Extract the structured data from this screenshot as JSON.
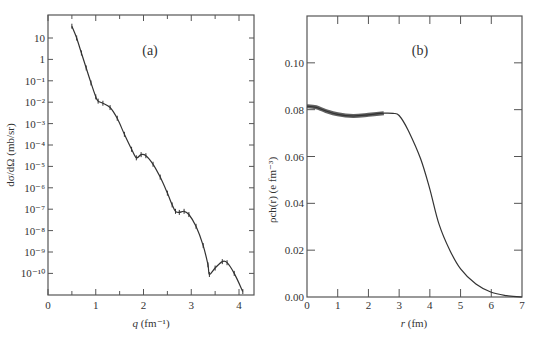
{
  "chart_data": [
    {
      "type": "line",
      "panel_label": "(a)",
      "title": "",
      "xlabel": "q (fm⁻¹)",
      "xlabel_var": "q",
      "xlabel_unit": "(fm⁻¹)",
      "ylabel": "dσ/dΩ (mb/sr)",
      "yscale": "log",
      "xlim": [
        0,
        4.3
      ],
      "ylim": [
        1e-11,
        120
      ],
      "x_ticks": [
        0,
        1,
        2,
        3,
        4
      ],
      "x_minor_tick_step": 0.5,
      "y_ticks": [
        "10",
        "1",
        "10⁻¹",
        "10⁻²",
        "10⁻³",
        "10⁻⁴",
        "10⁻⁵",
        "10⁻⁶",
        "10⁻⁷",
        "10⁻⁸",
        "10⁻⁹",
        "10⁻¹⁰"
      ],
      "y_tick_log10": [
        1,
        0,
        -1,
        -2,
        -3,
        -4,
        -5,
        -6,
        -7,
        -8,
        -9,
        -10
      ],
      "series": [
        {
          "name": "fit + data",
          "x": [
            0.5,
            0.6,
            0.7,
            0.8,
            0.9,
            1.0,
            1.05,
            1.15,
            1.3,
            1.45,
            1.6,
            1.75,
            1.85,
            1.95,
            2.05,
            2.2,
            2.35,
            2.5,
            2.6,
            2.67,
            2.75,
            2.85,
            2.95,
            3.1,
            3.25,
            3.35,
            3.38,
            3.5,
            3.65,
            3.75,
            3.9,
            4.08
          ],
          "log10_y": [
            1.55,
            1.0,
            0.3,
            -0.4,
            -1.1,
            -1.75,
            -1.95,
            -2.05,
            -2.25,
            -2.75,
            -3.5,
            -4.2,
            -4.6,
            -4.45,
            -4.5,
            -4.9,
            -5.5,
            -6.25,
            -6.8,
            -7.1,
            -7.15,
            -7.1,
            -7.25,
            -7.8,
            -8.7,
            -9.6,
            -10.05,
            -9.75,
            -9.45,
            -9.5,
            -10.0,
            -10.85
          ]
        }
      ]
    },
    {
      "type": "line",
      "panel_label": "(b)",
      "title": "",
      "xlabel": "r (fm)",
      "xlabel_var": "r",
      "xlabel_unit": "(fm)",
      "ylabel": "ρch(r) (e fm⁻³)",
      "xlim": [
        0,
        7
      ],
      "ylim": [
        0,
        0.12
      ],
      "x_ticks": [
        0,
        1,
        2,
        3,
        4,
        5,
        6,
        7
      ],
      "y_ticks": [
        "0.00",
        "0.02",
        "0.04",
        "0.06",
        "0.08",
        "0.10"
      ],
      "y_tick_values": [
        0,
        0.02,
        0.04,
        0.06,
        0.08,
        0.1
      ],
      "series": [
        {
          "name": "charge density (error band)",
          "x": [
            0.0,
            0.3,
            0.6,
            1.0,
            1.5,
            2.0,
            2.5,
            2.8,
            3.0,
            3.3,
            3.7,
            4.0,
            4.3,
            4.65,
            5.0,
            5.5,
            6.0,
            6.5,
            7.0
          ],
          "y": [
            0.0815,
            0.081,
            0.0795,
            0.078,
            0.0773,
            0.0778,
            0.0785,
            0.0784,
            0.0775,
            0.071,
            0.059,
            0.046,
            0.031,
            0.02,
            0.012,
            0.0055,
            0.002,
            0.0006,
            0.0
          ],
          "band_until_r": 2.5
        }
      ]
    }
  ]
}
